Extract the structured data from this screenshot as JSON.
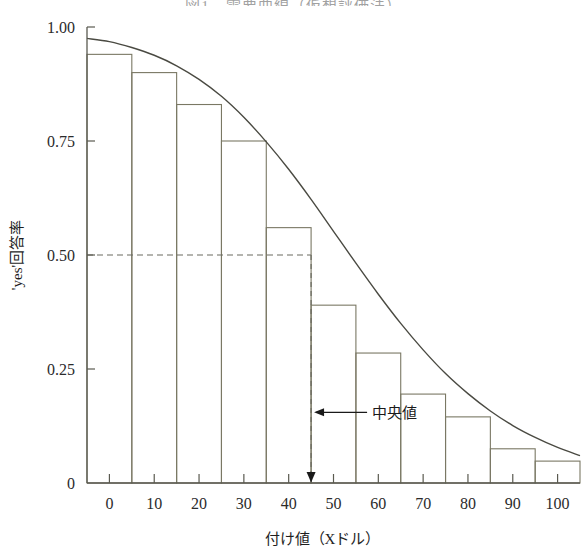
{
  "chart_data": {
    "type": "bar",
    "title": "図1　需要曲線（仮想評価法）",
    "xlabel": "付け値（Xドル）",
    "ylabel": "'yes'回答率",
    "xlim": [
      -5,
      105
    ],
    "ylim": [
      0,
      1.0
    ],
    "grid": false,
    "legend": null,
    "x_ticks": [
      "0",
      "10",
      "20",
      "30",
      "40",
      "50",
      "60",
      "70",
      "80",
      "90",
      "100"
    ],
    "x_tick_values": [
      0,
      10,
      20,
      30,
      40,
      50,
      60,
      70,
      80,
      90,
      100
    ],
    "y_ticks": [
      "1.00",
      "0.75",
      "0.50",
      "0.25",
      "0"
    ],
    "y_tick_values": [
      1.0,
      0.75,
      0.5,
      0.25,
      0
    ],
    "bar_edges": [
      -5,
      5,
      15,
      25,
      35,
      45,
      55,
      65,
      75,
      85,
      95,
      105
    ],
    "categories": [
      "0",
      "10",
      "20",
      "30",
      "40",
      "50",
      "60",
      "70",
      "80",
      "90",
      "100"
    ],
    "values": [
      0.94,
      0.9,
      0.83,
      0.75,
      0.56,
      0.39,
      0.285,
      0.195,
      0.145,
      0.075,
      0.048
    ],
    "series": [
      {
        "name": "'yes'回答率（実測）",
        "type": "bar",
        "values": [
          0.94,
          0.9,
          0.83,
          0.75,
          0.56,
          0.39,
          0.285,
          0.195,
          0.145,
          0.075,
          0.048
        ]
      },
      {
        "name": "需要曲線（推定）",
        "type": "line",
        "x": [
          -5,
          0,
          5,
          10,
          15,
          20,
          25,
          30,
          35,
          40,
          45,
          50,
          55,
          60,
          65,
          70,
          75,
          80,
          85,
          90,
          95,
          100,
          105
        ],
        "y": [
          0.975,
          0.968,
          0.955,
          0.938,
          0.915,
          0.885,
          0.848,
          0.802,
          0.748,
          0.688,
          0.622,
          0.552,
          0.482,
          0.414,
          0.35,
          0.292,
          0.24,
          0.196,
          0.158,
          0.126,
          0.1,
          0.078,
          0.06
        ]
      }
    ],
    "annotations": [
      {
        "name": "median",
        "label": "中央値",
        "x": 45,
        "y_from": 0.5,
        "y_to": 0.0,
        "arrow": "left",
        "guide": "dashed"
      },
      {
        "name": "median-gridline",
        "label": "",
        "y": 0.5,
        "x_from": -5,
        "x_to": 45,
        "style": "dashed"
      }
    ],
    "colors": {
      "bar_stroke": "#7a7864",
      "curve": "#4a4a42",
      "axis": "#5a5a50",
      "dashed": "#6b6b60",
      "text": "#1e1e1e",
      "background": "#ffffff"
    }
  }
}
